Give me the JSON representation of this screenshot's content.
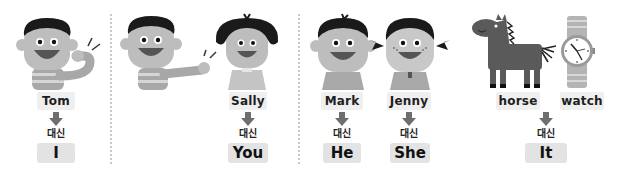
{
  "panels": [
    {
      "id": "first-person",
      "nouns": [
        "Tom"
      ],
      "connector": "대신",
      "pronoun": "I"
    },
    {
      "id": "second-person",
      "nouns": [
        "Sally"
      ],
      "connector": "대신",
      "pronoun": "You"
    },
    {
      "id": "third-person-male",
      "nouns": [
        "Mark"
      ],
      "connector": "대신",
      "pronoun": "He"
    },
    {
      "id": "third-person-female",
      "nouns": [
        "Jenny"
      ],
      "connector": "대신",
      "pronoun": "She"
    },
    {
      "id": "third-person-thing",
      "nouns": [
        "horse",
        "watch"
      ],
      "connector": "대신",
      "pronoun": "It"
    }
  ],
  "colors": {
    "skin": "#bdbdbd",
    "hair": "#1a1a1a",
    "mouth": "#555555",
    "shirt": "#a8a8a8",
    "stripe": "#d6d6d6",
    "horse": "#5a5a5a",
    "tag_bg": "#efefef",
    "pronoun_bg": "#e3e3e3"
  }
}
